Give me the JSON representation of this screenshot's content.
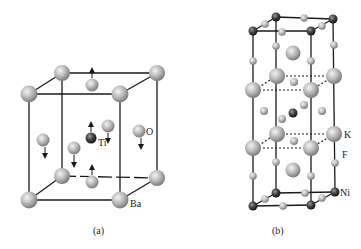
{
  "figure_a": {
    "caption": "(a)",
    "labels": {
      "ti": "Ti",
      "o": "O",
      "ba": "Ba"
    },
    "description": "BaTiO3 perovskite unit cell with displacement arrows"
  },
  "figure_b": {
    "caption": "(b)",
    "labels": {
      "k": "K",
      "f": "F",
      "ni": "Ni"
    },
    "description": "K2NiF4-type layered unit cell"
  },
  "colors": {
    "large_atom": "#b5b5b5",
    "small_atom": "#c2c2c2",
    "dark_atom": "#3a3a3a",
    "edge": "#1a1a1a",
    "background": "#ffffff"
  }
}
